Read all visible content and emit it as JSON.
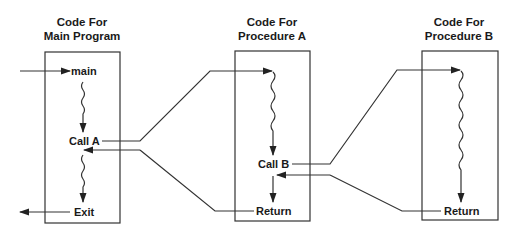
{
  "diagram": {
    "columns": [
      {
        "title_line1": "Code For",
        "title_line2": "Main Program",
        "labels": {
          "entry": "main",
          "call": "Call A",
          "end": "Exit"
        }
      },
      {
        "title_line1": "Code For",
        "title_line2": "Procedure A",
        "labels": {
          "call": "Call B",
          "end": "Return"
        }
      },
      {
        "title_line1": "Code For",
        "title_line2": "Procedure B",
        "labels": {
          "end": "Return"
        }
      }
    ],
    "colors": {
      "stroke": "#333333",
      "text": "#1a1a1a",
      "background": "#ffffff"
    }
  }
}
